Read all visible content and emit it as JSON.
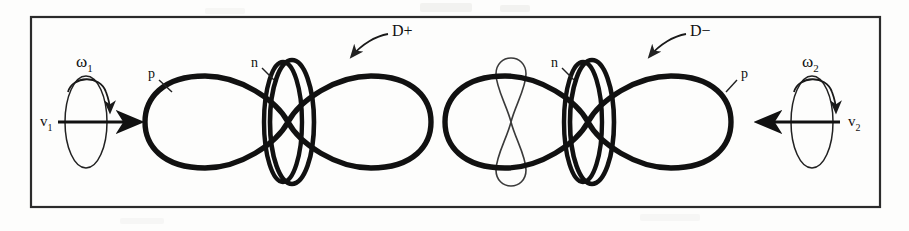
{
  "figure": {
    "border_color": "#2b2b2b",
    "ink_color": "#111111",
    "thin_ink_color": "#3a3a3a",
    "background_color": "#fdfdfc",
    "border": {
      "x": 31,
      "y": 17,
      "width": 849,
      "height": 190
    }
  },
  "left_particle": {
    "name": "D+",
    "charge_label": "D+",
    "proton_label": "p",
    "neutron_label": "n",
    "omega_label": "ω",
    "omega_subscript": "1",
    "velocity_label": "v",
    "velocity_subscript": "1",
    "velocity_direction": "right",
    "spin_direction": "clockwise",
    "lemniscate": {
      "center_x": 288,
      "center_y": 122,
      "half_width": 143,
      "lobe_height": 47
    },
    "neutron_rings": {
      "center_x": 288,
      "center_y": 122,
      "outer_rx": 23,
      "outer_ry": 62,
      "inner_rx": 17,
      "inner_ry": 58
    },
    "spin_ellipse": {
      "center_x": 86,
      "center_y": 122,
      "rx": 21,
      "ry": 46
    },
    "velocity_arrow": {
      "x1": 58,
      "y1": 122,
      "x2": 143,
      "y2": 122
    }
  },
  "right_particle": {
    "name": "D-",
    "charge_label": "D−",
    "proton_label": "p",
    "neutron_label": "n",
    "omega_label": "ω",
    "omega_subscript": "2",
    "velocity_label": "v",
    "velocity_subscript": "2",
    "velocity_direction": "left",
    "spin_direction": "clockwise",
    "lemniscate": {
      "center_x": 588,
      "center_y": 122,
      "half_width": 143,
      "lobe_height": 47
    },
    "neutron_rings": {
      "center_x": 588,
      "center_y": 122,
      "outer_rx": 23,
      "outer_ry": 62,
      "inner_rx": 17,
      "inner_ry": 58
    },
    "inner_thin_lemniscate": {
      "center_x": 511,
      "center_y": 122,
      "half_width": 20,
      "lobe_height": 48
    },
    "spin_ellipse": {
      "center_x": 812,
      "center_y": 122,
      "rx": 21,
      "ry": 46
    },
    "velocity_arrow": {
      "x1": 840,
      "y1": 122,
      "x2": 755,
      "y2": 122
    }
  },
  "labels": {
    "d_plus": {
      "text": "D+",
      "x": 392,
      "y": 36
    },
    "d_minus": {
      "text": "D−",
      "x": 690,
      "y": 36
    },
    "p_left": {
      "text": "p",
      "x": 148,
      "y": 76
    },
    "n_left": {
      "text": "n",
      "x": 251,
      "y": 66
    },
    "p_right": {
      "text": "p",
      "x": 741,
      "y": 76
    },
    "n_right": {
      "text": "n",
      "x": 551,
      "y": 66
    },
    "omega_1": {
      "text": "ω",
      "sub": "1",
      "x": 82,
      "y": 66
    },
    "omega_2": {
      "text": "ω",
      "sub": "2",
      "x": 808,
      "y": 66
    },
    "v_1": {
      "text": "v",
      "sub": "1",
      "x": 44,
      "y": 124
    },
    "v_2": {
      "text": "v",
      "sub": "2",
      "x": 852,
      "y": 124
    }
  }
}
